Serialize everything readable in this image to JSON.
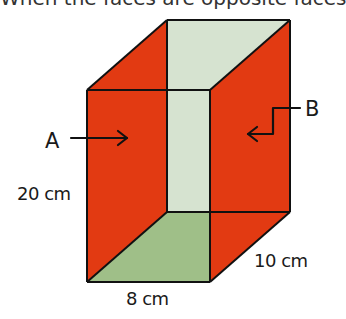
{
  "caption": {
    "text": "When the faces are opposite faces"
  },
  "colors": {
    "side_faces": "#e23a12",
    "back_face": "#d6e3d0",
    "bottom_face": "#9fbf88",
    "edge": "#111111",
    "text": "#1a1a1a"
  },
  "prism": {
    "front_top_left": [
      87,
      90
    ],
    "front_top_right": [
      210,
      90
    ],
    "front_bottom_left": [
      87,
      282
    ],
    "front_bottom_right": [
      210,
      282
    ],
    "back_top_left": [
      167,
      20
    ],
    "back_top_right": [
      290,
      20
    ],
    "back_bottom_left": [
      167,
      212
    ],
    "back_bottom_right": [
      290,
      212
    ]
  },
  "labels": {
    "face_a": "A",
    "face_b": "B",
    "height": "20 cm",
    "width": "8 cm",
    "depth": "10 cm"
  }
}
